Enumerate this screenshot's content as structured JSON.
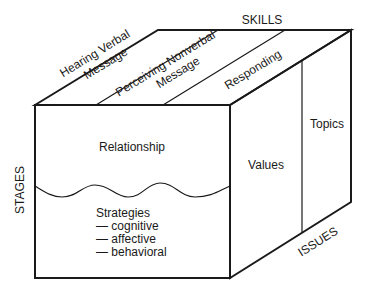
{
  "diagram": {
    "type": "3d-cube-model",
    "axes": {
      "top": "SKILLS",
      "left": "STAGES",
      "bottom_right": "ISSUES"
    },
    "top_face": {
      "columns": [
        {
          "line1": "Hearing Verbal",
          "line2": "Message"
        },
        {
          "line1": "Perceiving Nonverbal",
          "line2": "Message"
        },
        {
          "line1": "Responding",
          "line2": ""
        }
      ]
    },
    "front_face": {
      "upper_label": "Relationship",
      "lower_title": "Strategies",
      "lower_items": [
        "— cognitive",
        "— affective",
        "— behavioral"
      ]
    },
    "right_face": {
      "columns": [
        "Values",
        "Topics"
      ]
    },
    "colors": {
      "line": "#1a1a1a",
      "background": "#ffffff"
    }
  }
}
